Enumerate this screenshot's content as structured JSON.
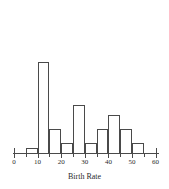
{
  "chart_data": {
    "type": "bar",
    "title": "",
    "subtitle": "",
    "xlabel": "Birth Rate",
    "ylabel": "",
    "xlim": [
      0,
      60
    ],
    "ylim": [
      0,
      20
    ],
    "grid": false,
    "legend": null,
    "bin_width": 5,
    "categories": [
      "5-10",
      "10-15",
      "15-20",
      "20-25",
      "25-30",
      "30-35",
      "35-40",
      "40-45",
      "45-50",
      "50-55"
    ],
    "bin_starts": [
      5,
      10,
      15,
      20,
      25,
      30,
      35,
      40,
      45,
      50
    ],
    "bin_ends": [
      10,
      15,
      20,
      25,
      30,
      35,
      40,
      45,
      50,
      55
    ],
    "values": [
      1,
      19,
      5,
      2,
      10,
      2,
      5,
      8,
      5,
      2
    ],
    "xticks": [
      0,
      10,
      20,
      30,
      40,
      50,
      60
    ],
    "xtick_labels": [
      "0",
      "10",
      "20",
      "30",
      "40",
      "50",
      "60"
    ],
    "minor_tick_step": 5,
    "bar_edge_color": "#4a4a4a",
    "bar_fill_color": "transparent",
    "axis_color": "#4a4a4a",
    "background_color": "#ffffff"
  },
  "axis": {
    "x_title": "Birth Rate"
  }
}
